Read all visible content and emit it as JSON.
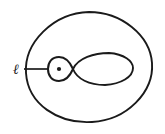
{
  "figure": {
    "kind": "mathematical-diagram",
    "background_color": "#ffffff",
    "stroke_color": "#1a1a1a",
    "width": 165,
    "height": 134
  },
  "labels": {
    "loop_label": "ℓ",
    "node_marker": "•"
  },
  "geometry": {
    "outer_boundary": {
      "center_x": 89,
      "center_y": 67,
      "radius_x": 63,
      "radius_y": 55
    },
    "small_loop": {
      "center_x": 59,
      "center_y": 69,
      "radius_x": 11,
      "radius_y": 12
    },
    "crossing_point": {
      "x": 73,
      "y": 69
    },
    "large_lens": {
      "left_x": 73,
      "right_x": 133,
      "top_y": 53,
      "bottom_y": 85
    },
    "leader_line": {
      "start_x": 24,
      "start_y": 69,
      "end_x": 48,
      "end_y": 69
    },
    "node_dot": {
      "x": 59,
      "y": 69,
      "radius": 2.1
    },
    "label_position": {
      "x": 13,
      "y": 74
    }
  }
}
